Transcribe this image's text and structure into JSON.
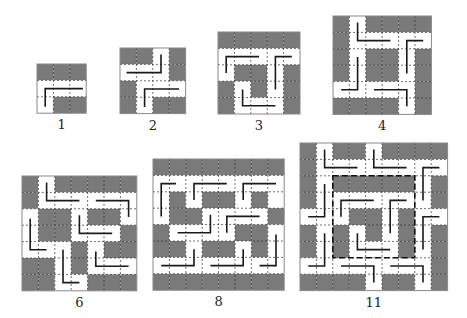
{
  "colors": {
    "dark": "#7a7a7a",
    "light": "#ffffff",
    "grid_line": "#333333",
    "path": "#1a1a1a",
    "border": "#888888"
  },
  "cell_size": 16.4,
  "figures": [
    {
      "label": "1",
      "x": 37,
      "y": 64,
      "n": 3,
      "grid": [
        "DDD",
        "WWW",
        "WDD"
      ],
      "paths": [
        [
          [
            2.8,
            1.5
          ],
          [
            0.5,
            1.5
          ],
          [
            0.5,
            2.6
          ]
        ]
      ],
      "dashed_box": null
    },
    {
      "label": "2",
      "x": 120,
      "y": 48,
      "n": 4,
      "grid": [
        "DDWD",
        "WWWD",
        "DWWW",
        "DWDD"
      ],
      "paths": [
        [
          [
            2.5,
            0.4
          ],
          [
            2.5,
            1.5
          ],
          [
            0.4,
            1.5
          ]
        ],
        [
          [
            3.6,
            2.5
          ],
          [
            1.5,
            2.5
          ],
          [
            1.5,
            3.6
          ]
        ]
      ],
      "dashed_box": null
    },
    {
      "label": "3",
      "x": 218,
      "y": 32,
      "n": 5,
      "grid": [
        "DDDDD",
        "WWWWW",
        "WDDWD",
        "DWDWD",
        "DWWWD"
      ],
      "paths": [
        [
          [
            2.5,
            1.5
          ],
          [
            0.5,
            1.5
          ],
          [
            0.5,
            2.5
          ]
        ],
        [
          [
            4.5,
            1.5
          ],
          [
            3.5,
            1.5
          ],
          [
            3.5,
            3.5
          ]
        ],
        [
          [
            1.5,
            3.5
          ],
          [
            1.5,
            4.5
          ],
          [
            3.5,
            4.5
          ]
        ]
      ],
      "dashed_box": null
    },
    {
      "label": "4",
      "x": 333,
      "y": 16,
      "n": 6,
      "grid": [
        "DWDDDD",
        "DWWWWW",
        "DWDDWD",
        "DWDDWD",
        "WWWWWD",
        "DDDDWD"
      ],
      "paths": [
        [
          [
            1.5,
            0.4
          ],
          [
            1.5,
            1.5
          ],
          [
            3.5,
            1.5
          ]
        ],
        [
          [
            5.5,
            1.5
          ],
          [
            4.5,
            1.5
          ],
          [
            4.5,
            3.5
          ]
        ],
        [
          [
            1.5,
            2.5
          ],
          [
            1.5,
            4.5
          ],
          [
            0.5,
            4.5
          ]
        ],
        [
          [
            2.5,
            4.5
          ],
          [
            4.5,
            4.5
          ],
          [
            4.5,
            5.5
          ]
        ]
      ],
      "dashed_box": null
    },
    {
      "label": "6",
      "x": 22,
      "y": 176,
      "n": 7,
      "grid": [
        "DWDDDDD",
        "DWWWWWW",
        "WDDWDDW",
        "WDDWWWD",
        "WWWDWDD",
        "DDWDWWW",
        "DDWWDDD"
      ],
      "paths": [
        [
          [
            1.5,
            0.4
          ],
          [
            1.5,
            1.5
          ],
          [
            3.5,
            1.5
          ]
        ],
        [
          [
            4.5,
            1.5
          ],
          [
            6.5,
            1.5
          ],
          [
            6.5,
            2.5
          ]
        ],
        [
          [
            3.5,
            2.4
          ],
          [
            3.5,
            3.5
          ],
          [
            5.5,
            3.5
          ]
        ],
        [
          [
            0.5,
            2.6
          ],
          [
            0.5,
            4.5
          ],
          [
            1.5,
            4.5
          ]
        ],
        [
          [
            2.5,
            4.5
          ],
          [
            2.5,
            6.5
          ],
          [
            3.5,
            6.5
          ]
        ],
        [
          [
            4.5,
            4.6
          ],
          [
            4.5,
            5.5
          ],
          [
            6.5,
            5.5
          ]
        ]
      ],
      "dashed_box": null
    },
    {
      "label": "8",
      "x": 153,
      "y": 159,
      "n": 8,
      "grid": [
        "DDDDDDDD",
        "WWWWWWWW",
        "WDWDDWDW",
        "WDDWWWWD",
        "DWWWWDDW",
        "DDWDDWDW",
        "WWWWWWWW",
        "DDDDDDDD"
      ],
      "paths": [
        [
          [
            1.4,
            1.5
          ],
          [
            0.5,
            1.5
          ],
          [
            0.5,
            3.5
          ]
        ],
        [
          [
            4.5,
            1.5
          ],
          [
            2.5,
            1.5
          ],
          [
            2.5,
            2.5
          ]
        ],
        [
          [
            7.5,
            1.5
          ],
          [
            5.5,
            1.5
          ],
          [
            5.5,
            2.5
          ]
        ],
        [
          [
            3.5,
            3.4
          ],
          [
            3.5,
            4.5
          ],
          [
            1.5,
            4.5
          ]
        ],
        [
          [
            6.5,
            3.5
          ],
          [
            4.5,
            3.5
          ],
          [
            4.5,
            4.5
          ]
        ],
        [
          [
            7.5,
            4.6
          ],
          [
            7.5,
            6.5
          ],
          [
            6.5,
            6.5
          ]
        ],
        [
          [
            2.5,
            5.5
          ],
          [
            2.5,
            6.5
          ],
          [
            0.5,
            6.5
          ]
        ],
        [
          [
            5.5,
            5.5
          ],
          [
            5.5,
            6.5
          ],
          [
            3.5,
            6.5
          ]
        ]
      ],
      "dashed_box": null
    },
    {
      "label": "11",
      "x": 300,
      "y": 143,
      "n": 9,
      "grid": [
        "DWDDWDDDD",
        "DWWWWWWWW",
        "DWDDDDDWD",
        "DWWWWWWWD",
        "WWWDDWDWW",
        "DWDWDWDWD",
        "DWDWWWDWD",
        "WWWWWWWWD",
        "DDDDWDDWD"
      ],
      "paths": [
        [
          [
            1.5,
            0.4
          ],
          [
            1.5,
            1.5
          ],
          [
            3.5,
            1.5
          ]
        ],
        [
          [
            4.5,
            0.4
          ],
          [
            4.5,
            1.5
          ],
          [
            6.5,
            1.5
          ]
        ],
        [
          [
            8.5,
            1.5
          ],
          [
            7.5,
            1.5
          ],
          [
            7.5,
            3.5
          ]
        ],
        [
          [
            1.5,
            2.5
          ],
          [
            1.5,
            4.5
          ],
          [
            0.5,
            4.5
          ]
        ],
        [
          [
            4.5,
            3.5
          ],
          [
            2.5,
            3.5
          ],
          [
            2.5,
            4.5
          ]
        ],
        [
          [
            6.5,
            3.5
          ],
          [
            5.5,
            3.5
          ],
          [
            5.5,
            5.5
          ]
        ],
        [
          [
            8.5,
            4.5
          ],
          [
            7.5,
            4.5
          ],
          [
            7.5,
            6.5
          ]
        ],
        [
          [
            3.5,
            5.5
          ],
          [
            3.5,
            6.5
          ],
          [
            5.5,
            6.5
          ]
        ],
        [
          [
            1.5,
            5.5
          ],
          [
            1.5,
            7.5
          ],
          [
            0.5,
            7.5
          ]
        ],
        [
          [
            2.5,
            7.5
          ],
          [
            4.5,
            7.5
          ],
          [
            4.5,
            8.5
          ]
        ],
        [
          [
            5.5,
            7.5
          ],
          [
            7.5,
            7.5
          ],
          [
            7.5,
            8.5
          ]
        ]
      ],
      "dashed_box": {
        "col": 2,
        "row": 2,
        "w": 5,
        "h": 5
      }
    }
  ]
}
